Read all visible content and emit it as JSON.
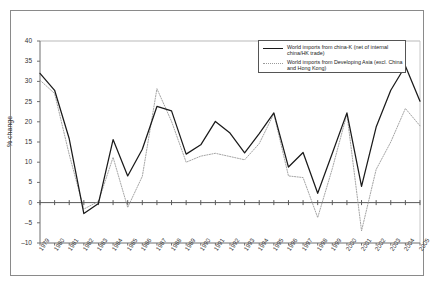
{
  "chart_data": {
    "type": "line",
    "title": "",
    "xlabel": "",
    "ylabel": "% change",
    "ylim": [
      -10,
      40
    ],
    "yticks": [
      -10,
      -5,
      0,
      5,
      10,
      15,
      20,
      25,
      30,
      35,
      40
    ],
    "grid": false,
    "legend_position": "top-right",
    "categories": [
      "1979",
      "1980",
      "1981",
      "1982",
      "1983",
      "1984",
      "1985",
      "1986",
      "1987",
      "1988",
      "1989",
      "1990",
      "1991",
      "1992",
      "1993",
      "1994",
      "1995",
      "1996",
      "1997",
      "1998",
      "1999",
      "2000",
      "2001",
      "2002",
      "2003",
      "2004",
      "2005"
    ],
    "series": [
      {
        "name": "World imports from china-K (net of internal china/HK trade)",
        "style": "solid",
        "color": "#1a1a1a",
        "values": [
          32.0,
          27.8,
          15.8,
          -2.7,
          -0.2,
          15.6,
          6.6,
          13.2,
          23.8,
          22.7,
          12.0,
          14.3,
          20.1,
          17.2,
          12.3,
          17.1,
          22.2,
          8.8,
          12.4,
          2.3,
          12.2,
          22.2,
          4.0,
          18.7,
          27.8,
          33.8,
          25.1
        ]
      },
      {
        "name": "World imports from Developing Asia (excl. China and Hong Kong)",
        "style": "dotted",
        "color": "#9a9a9a",
        "values": [
          30.3,
          27.0,
          11.9,
          -1.6,
          0.3,
          11.2,
          -1.2,
          6.5,
          28.2,
          20.1,
          10.0,
          11.5,
          12.2,
          11.4,
          10.6,
          14.6,
          22.0,
          6.6,
          6.2,
          -3.7,
          8.4,
          21.9,
          -7.0,
          8.2,
          15.0,
          23.3,
          19.0
        ]
      }
    ]
  },
  "legend": {
    "entries": [
      {
        "label": "World imports from china-K (net of internal china/HK trade)",
        "style": "solid"
      },
      {
        "label": "World imports from Developing Asia (excl. China and Hong Kong)",
        "style": "dotted"
      }
    ]
  }
}
